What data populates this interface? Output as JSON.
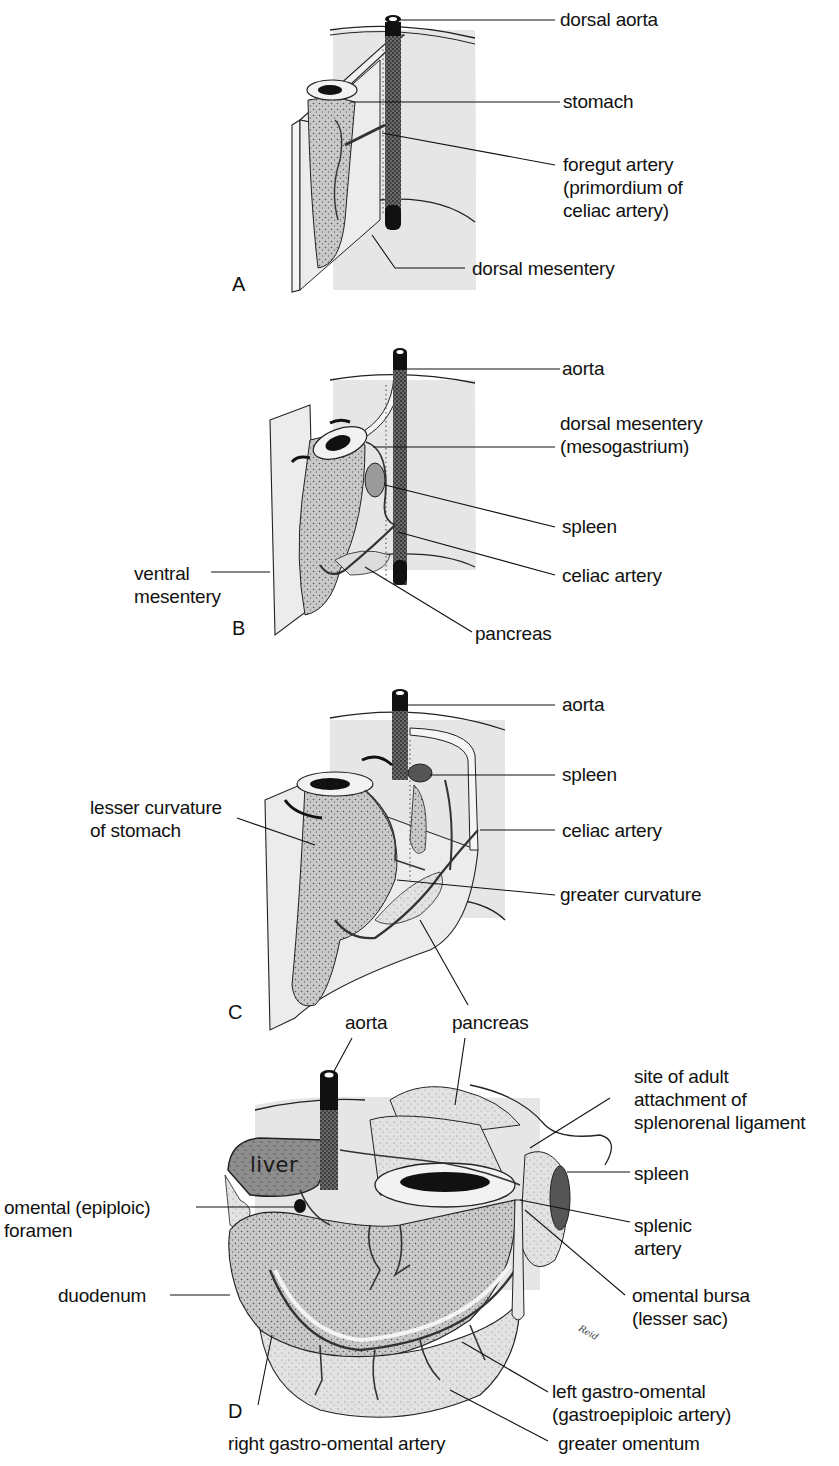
{
  "figure": {
    "colors": {
      "background": "#ffffff",
      "mesentery": "#e6e6e6",
      "organ": "#bdbdbd",
      "organ_dark": "#8a8a8a",
      "aorta": "#111111",
      "ink": "#111111"
    },
    "panels": [
      {
        "letter": "A",
        "labels": [
          {
            "text": "dorsal aorta"
          },
          {
            "text": "stomach"
          },
          {
            "text": "foregut artery\n(primordium of\nceliac artery)"
          },
          {
            "text": "dorsal mesentery"
          }
        ]
      },
      {
        "letter": "B",
        "labels": [
          {
            "text": "aorta"
          },
          {
            "text": "dorsal mesentery\n(mesogastrium)"
          },
          {
            "text": "ventral\nmesentery"
          },
          {
            "text": "spleen"
          },
          {
            "text": "celiac artery"
          },
          {
            "text": "pancreas"
          }
        ]
      },
      {
        "letter": "C",
        "labels": [
          {
            "text": "aorta"
          },
          {
            "text": "spleen"
          },
          {
            "text": "lesser curvature\nof stomach"
          },
          {
            "text": "celiac artery"
          },
          {
            "text": "greater curvature"
          },
          {
            "text": "pancreas"
          }
        ]
      },
      {
        "letter": "D",
        "organ_text": "liver",
        "signature": "Reid",
        "labels": [
          {
            "text": "aorta"
          },
          {
            "text": "site of adult\nattachment of\nsplenorenal ligament"
          },
          {
            "text": "spleen"
          },
          {
            "text": "omental (epiploic)\nforamen"
          },
          {
            "text": "splenic\nartery"
          },
          {
            "text": "duodenum"
          },
          {
            "text": "omental bursa\n(lesser sac)"
          },
          {
            "text": "left gastro-omental\n(gastroepiploic artery)"
          },
          {
            "text": "right gastro-omental artery"
          },
          {
            "text": "greater omentum"
          }
        ]
      }
    ]
  }
}
